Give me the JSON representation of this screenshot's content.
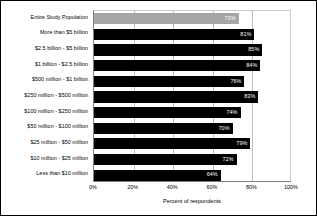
{
  "chart_data": {
    "type": "bar",
    "orientation": "horizontal",
    "title": "",
    "xlabel": "Percent of respondents",
    "ylabel": "",
    "xlim": [
      0,
      100
    ],
    "xticks": [
      "0%",
      "20%",
      "40%",
      "60%",
      "80%",
      "100%"
    ],
    "xtick_values": [
      0,
      20,
      40,
      60,
      80,
      100
    ],
    "grid": true,
    "grid_axis": "x",
    "legend": false,
    "value_label_suffix": "%",
    "colors": {
      "bar": "#000000",
      "highlight_bar": "#a6a6a6",
      "value_label": "#ffffff",
      "gridline": "#c0c0c0",
      "axis": "#808080",
      "text": "#000000",
      "background": "#ffffff"
    },
    "categories": [
      "Entire Study Population",
      "More than $5 billion",
      "$2.5 billion - $5 billion",
      "$1 billion - $2.5 billion",
      "$500 million - $1 billion",
      "$250 million - $500 million",
      "$100 million - $250 million",
      "$50 million - $100 million",
      "$25 million - $50 million",
      "$10 million - $25 million",
      "Less than $10 million"
    ],
    "values": [
      73,
      81,
      85,
      84,
      76,
      83,
      74,
      70,
      79,
      72,
      64
    ],
    "value_labels": [
      "73%",
      "81%",
      "85%",
      "84%",
      "76%",
      "83%",
      "74%",
      "70%",
      "79%",
      "72%",
      "64%"
    ],
    "highlight_index": 0
  }
}
